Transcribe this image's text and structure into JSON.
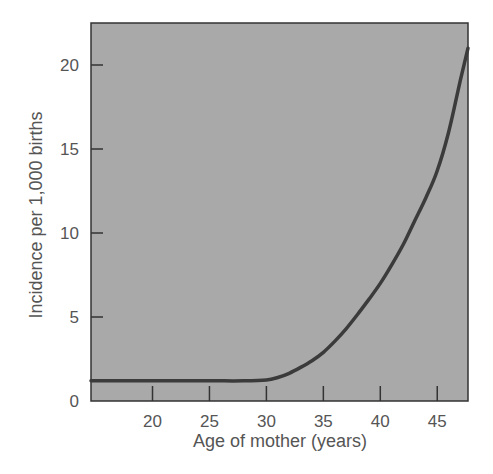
{
  "chart_data": {
    "type": "line",
    "title": "",
    "xlabel": "Age of mother (years)",
    "ylabel": "Incidence per 1,000 births",
    "xlim": [
      14.6,
      47.7
    ],
    "ylim": [
      0,
      22.5
    ],
    "x_ticks": [
      20,
      25,
      30,
      35,
      40,
      45
    ],
    "y_ticks": [
      0,
      5,
      10,
      15,
      20
    ],
    "grid": false,
    "legend": null,
    "colors": {
      "plot_background": "#a9a9a9",
      "line": "#3b3b3b",
      "axis": "#333333",
      "text": "#555555"
    },
    "series": [
      {
        "name": "Incidence",
        "x": [
          14.6,
          20,
          25,
          28,
          30,
          31,
          32,
          33,
          34,
          35,
          36,
          37,
          38,
          39,
          40,
          41,
          42,
          43,
          44,
          45,
          46,
          47,
          47.7
        ],
        "y": [
          1.2,
          1.2,
          1.2,
          1.2,
          1.25,
          1.4,
          1.65,
          2.0,
          2.4,
          2.9,
          3.55,
          4.3,
          5.15,
          6.05,
          7.0,
          8.1,
          9.3,
          10.7,
          12.1,
          13.7,
          16.0,
          19.0,
          21.0
        ]
      }
    ]
  }
}
